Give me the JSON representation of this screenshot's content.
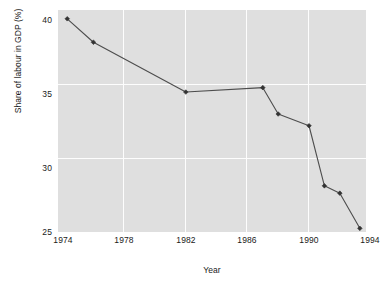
{
  "chart_data": {
    "type": "line",
    "title": "",
    "xlabel": "Year",
    "ylabel": "Share of labour in GDP (%)",
    "xlim": [
      1973.7,
      1993.7
    ],
    "ylim": [
      24.85,
      40.0
    ],
    "xticks": [
      1974,
      1978,
      1982,
      1986,
      1990,
      1994
    ],
    "xtick_labels": [
      "1974",
      "1978",
      "1982",
      "1986",
      "1990",
      "1994"
    ],
    "yticks": [
      25,
      30,
      35,
      40
    ],
    "ytick_labels": [
      "25",
      "30",
      "35",
      "40"
    ],
    "grid": true,
    "grid_color": "#fdfdfd",
    "plot_background": "#dfdfdf",
    "figure_background": "#ffffff",
    "legend": null,
    "series": [
      {
        "name": "Share of labour in GDP (%)",
        "line_color": "#4d4d4d",
        "marker": "diamond",
        "marker_color": "#333333",
        "x": [
          1974.3,
          1976.0,
          1982.0,
          1987.0,
          1988.0,
          1990.0,
          1991.0,
          1992.0,
          1993.3
        ],
        "y": [
          39.4,
          37.8,
          34.4,
          34.7,
          32.9,
          32.1,
          28.0,
          27.5,
          25.1
        ]
      }
    ]
  },
  "axes": {
    "y_tick_0": "25",
    "y_tick_1": "30",
    "y_tick_2": "35",
    "y_tick_3": "40",
    "x_tick_0": "1974",
    "x_tick_1": "1978",
    "x_tick_2": "1982",
    "x_tick_3": "1986",
    "x_tick_4": "1990",
    "x_tick_5": "1994"
  }
}
